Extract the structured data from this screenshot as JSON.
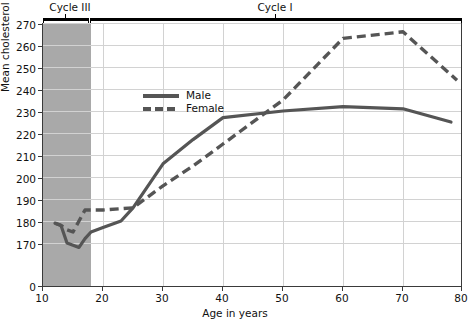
{
  "chart_data": {
    "type": "line",
    "title": "",
    "xlabel": "Age in years",
    "ylabel": "Mean cholesterol (mg/100 ml)",
    "xlim": [
      10,
      80
    ],
    "ylim": [
      165,
      272
    ],
    "xticks": [
      10,
      20,
      30,
      40,
      50,
      60,
      70,
      80
    ],
    "yticks": [
      0,
      170,
      180,
      190,
      200,
      210,
      220,
      230,
      240,
      250,
      260,
      270
    ],
    "y_axis_break": true,
    "grid": true,
    "legend_position": "upper-left-inside",
    "shaded_region": {
      "label": "Cycle III",
      "x_from": 10,
      "x_to": 18,
      "color": "#a9a9a9"
    },
    "annotations": [
      {
        "text": "Cycle III",
        "x_from": 10,
        "x_to": 18
      },
      {
        "text": "Cycle I",
        "x_from": 18,
        "x_to": 80
      }
    ],
    "series": [
      {
        "name": "Male",
        "style": "solid",
        "color": "#555555",
        "x": [
          12,
          13,
          14,
          15,
          16,
          17,
          18,
          20,
          23,
          25,
          30,
          35,
          40,
          50,
          60,
          70,
          78
        ],
        "values": [
          179,
          178,
          170,
          169,
          168,
          172,
          175,
          177,
          180,
          186,
          206,
          217,
          227,
          230,
          232,
          231,
          225
        ]
      },
      {
        "name": "Female",
        "style": "dashed",
        "color": "#555555",
        "x": [
          12,
          13,
          14,
          15,
          16,
          17,
          18,
          20,
          25,
          30,
          35,
          40,
          50,
          60,
          70,
          79
        ],
        "values": [
          179,
          178,
          176,
          175,
          180,
          185,
          185,
          185,
          186,
          196,
          205,
          215,
          235,
          263,
          266,
          244
        ]
      }
    ]
  },
  "axis": {
    "y_title": "Mean cholesterol (mg/100 ml)",
    "x_title": "Age in years",
    "y_tick_labels": [
      "270",
      "260",
      "250",
      "240",
      "230",
      "220",
      "210",
      "200",
      "190",
      "180",
      "170",
      "0"
    ],
    "x_tick_labels": [
      "10",
      "20",
      "30",
      "40",
      "50",
      "60",
      "70",
      "80"
    ]
  },
  "legend": {
    "items": [
      {
        "label": "Male",
        "style": "solid"
      },
      {
        "label": "Female",
        "style": "dashed"
      }
    ]
  },
  "brackets": {
    "cycle3": "Cycle III",
    "cycle1": "Cycle I"
  }
}
